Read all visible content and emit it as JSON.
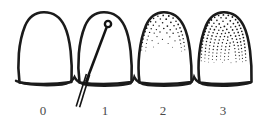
{
  "figure": {
    "kind": "dental-plaque-index-diagram",
    "background_color": "#ffffff",
    "ink_color": "#1b1b1b",
    "label_color": "#4a4a4a",
    "width": 261,
    "height": 126
  },
  "scale": {
    "labels": [
      "0",
      "1",
      "2",
      "3"
    ],
    "label_positions_x": [
      43,
      105,
      163,
      223
    ],
    "label_position_y": 104
  },
  "teeth": [
    {
      "score": "0",
      "name": "tooth-score-0",
      "plaque_coverage_percent": 0,
      "plaque_dot_count": 0,
      "has_probe": false,
      "description": "no plaque"
    },
    {
      "score": "1",
      "name": "tooth-score-1",
      "plaque_coverage_percent": 0,
      "plaque_dot_count": 0,
      "has_probe": true,
      "description": "plaque detected only by running probe across cervical margin"
    },
    {
      "score": "2",
      "name": "tooth-score-2",
      "plaque_coverage_percent": 33,
      "plaque_dot_count": 62,
      "has_probe": false,
      "description": "moderate plaque visible, thin band along gingival margin"
    },
    {
      "score": "3",
      "name": "tooth-score-3",
      "plaque_coverage_percent": 52,
      "plaque_dot_count": 150,
      "has_probe": false,
      "description": "abundance of soft matter, heavy plaque"
    }
  ],
  "probe": {
    "name": "periodontal-probe",
    "tip_x": 108,
    "tip_y": 24,
    "tip_radius": 3.1,
    "end_x": 77,
    "end_y": 107,
    "double_line": true
  },
  "geometry": {
    "tooth_left_edges": [
      14,
      74,
      134,
      194
    ],
    "tooth_width": 58,
    "crown_top_y": 12,
    "base_y": 83,
    "gum_line_y": 84
  }
}
